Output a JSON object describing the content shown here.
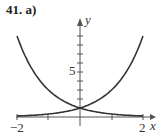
{
  "title": "41. a)",
  "chart_data": {
    "type": "line",
    "title": "41. a)",
    "xlabel": "x",
    "ylabel": "y",
    "xlim": [
      -2,
      2
    ],
    "ylim": [
      0,
      10
    ],
    "x_tick_labels": [
      "-2",
      "2"
    ],
    "y_tick_labels": [
      "5"
    ],
    "grid": false,
    "series": [
      {
        "name": "y = 3^x",
        "x": [
          -2,
          -1,
          0,
          1,
          2
        ],
        "values": [
          0.11,
          0.33,
          1,
          3,
          9
        ]
      },
      {
        "name": "y = 3^-x",
        "x": [
          -2,
          -1,
          0,
          1,
          2
        ],
        "values": [
          9,
          3,
          1,
          0.33,
          0.11
        ]
      }
    ]
  },
  "labels": {
    "x_axis": "x",
    "y_axis": "y",
    "x_min": "−2",
    "x_max": "2",
    "y_tick": "5"
  }
}
